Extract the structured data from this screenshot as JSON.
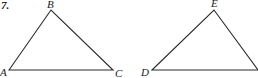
{
  "problem_number": "7.",
  "colors": {
    "stroke": "#2a2a2a",
    "label": "#222222",
    "background": "#ffffff"
  },
  "triangles": [
    {
      "name": "ABC",
      "vertices": [
        {
          "label": "A",
          "x": 9,
          "y": 70
        },
        {
          "label": "B",
          "x": 51,
          "y": 10
        },
        {
          "label": "C",
          "x": 113,
          "y": 70
        }
      ]
    },
    {
      "name": "DEF",
      "vertices": [
        {
          "label": "D",
          "x": 152,
          "y": 70
        },
        {
          "label": "E",
          "x": 214,
          "y": 10
        },
        {
          "label": "",
          "x": 258,
          "y": 70
        }
      ]
    }
  ],
  "labels": {
    "A": "A",
    "B": "B",
    "C": "C",
    "D": "D",
    "E": "E"
  }
}
